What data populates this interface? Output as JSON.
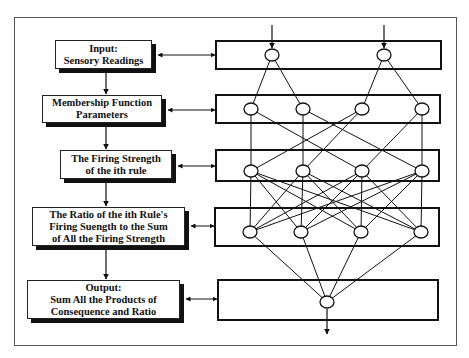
{
  "diagram": {
    "title": "",
    "type": "ANFIS five-layer architecture",
    "colors": {
      "stroke": "#111111",
      "frame": "#555555",
      "background": "#ffffff",
      "shadow": "#111111"
    },
    "left_boxes": [
      {
        "id": "box-input",
        "lines": [
          "Input:",
          "Sensory Readings"
        ]
      },
      {
        "id": "box-membership",
        "lines": [
          "Membership Function",
          "Parameters"
        ]
      },
      {
        "id": "box-firing",
        "lines": [
          "The Firing Strength",
          "of the ith rule"
        ]
      },
      {
        "id": "box-ratio",
        "lines": [
          "The Ratio of the ith Rule's",
          "Firing Suength to the Sum",
          "of All the Firing Strength"
        ]
      },
      {
        "id": "box-output",
        "lines": [
          "Output:",
          "Sum All the Products of",
          "Consequence and Ratio"
        ]
      }
    ],
    "layers": [
      {
        "name": "layer-1-input",
        "nodes": 2
      },
      {
        "name": "layer-2-membership",
        "nodes": 4
      },
      {
        "name": "layer-3-firing-strength",
        "nodes": 4
      },
      {
        "name": "layer-4-normalization",
        "nodes": 4
      },
      {
        "name": "layer-5-output",
        "nodes": 1
      }
    ],
    "connections": {
      "layer1_to_layer2": [
        [
          0,
          0
        ],
        [
          0,
          1
        ],
        [
          1,
          2
        ],
        [
          1,
          3
        ]
      ],
      "layer2_to_layer3": [
        [
          0,
          0
        ],
        [
          0,
          2
        ],
        [
          1,
          1
        ],
        [
          1,
          3
        ],
        [
          2,
          0
        ],
        [
          2,
          1
        ],
        [
          3,
          2
        ],
        [
          3,
          3
        ]
      ],
      "layer3_to_layer4": "fully-connected",
      "layer4_to_layer5": "fully-connected"
    }
  }
}
